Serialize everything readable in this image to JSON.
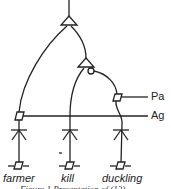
{
  "diagram": {
    "type": "dependency-structure",
    "relation_labels": {
      "patient": "Pa",
      "agent": "Ag"
    },
    "words": [
      "farmer",
      "kill",
      "duckling"
    ],
    "caption": "Figure 1 Presentation of (13)",
    "colors": {
      "stroke": "#222222",
      "background": "#ffffff"
    }
  }
}
